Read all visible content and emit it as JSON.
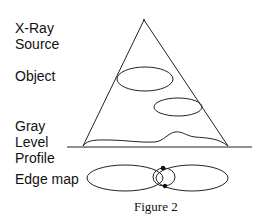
{
  "labels": {
    "xray_line1": "X-Ray",
    "xray_line2": "Source",
    "object": "Object",
    "gray_line1": "Gray",
    "gray_line2": "Level",
    "gray_line3": "Profile",
    "edge_map": "Edge map"
  },
  "caption": "Figure 2",
  "colors": {
    "stroke": "#222222",
    "text": "#111111",
    "background": "#ffffff"
  }
}
